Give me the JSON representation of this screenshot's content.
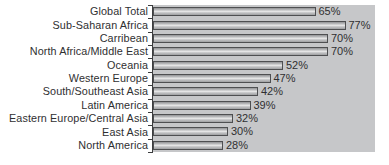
{
  "chart_data": {
    "type": "bar",
    "orientation": "horizontal",
    "title": "",
    "xlabel": "",
    "ylabel": "",
    "categories": [
      "Global Total",
      "Sub-Saharan Africa",
      "Carribean",
      "North Africa/Middle East",
      "Oceania",
      "Western Europe",
      "South/Southeast Asia",
      "Latin America",
      "Eastern Europe/Central Asia",
      "East Asia",
      "North America"
    ],
    "values": [
      65,
      77,
      70,
      70,
      52,
      47,
      42,
      39,
      32,
      30,
      28
    ],
    "value_suffix": "%",
    "value_labels": [
      "65%",
      "77%",
      "70%",
      "70%",
      "52%",
      "47%",
      "42%",
      "39%",
      "32%",
      "30%",
      "28%"
    ],
    "xlim": [
      0,
      88.8
    ],
    "grid": false,
    "legend": null,
    "value_labels_shown": true
  },
  "layout": {
    "px_per_percent": 2.5,
    "plot_height_px": 147,
    "bar_height_px": 9
  },
  "colors": {
    "page_background": "#ffffff",
    "plot_background": "#c6c7c9",
    "bar_border": "#4e4f51",
    "axis": "#3c3d3f",
    "text": "#2f2f31"
  }
}
